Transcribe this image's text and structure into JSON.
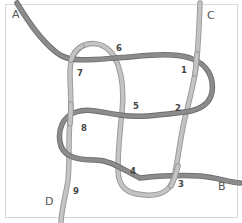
{
  "diagram": {
    "colors": {
      "frame": "#d9d9d9",
      "rope_dark": "#8c8c8c",
      "rope_light": "#c4c4c4",
      "labels": "#444444"
    },
    "end_labels": [
      {
        "id": "A",
        "text": "A",
        "x": 12,
        "y": 18
      },
      {
        "id": "B",
        "text": "B",
        "x": 218,
        "y": 190
      },
      {
        "id": "C",
        "text": "C",
        "x": 207,
        "y": 19
      },
      {
        "id": "D",
        "text": "D",
        "x": 45,
        "y": 205
      }
    ],
    "crossing_labels": [
      {
        "id": "1",
        "text": "1",
        "x": 181,
        "y": 73
      },
      {
        "id": "2",
        "text": "2",
        "x": 175,
        "y": 111
      },
      {
        "id": "3",
        "text": "3",
        "x": 178,
        "y": 187
      },
      {
        "id": "4",
        "text": "4",
        "x": 130,
        "y": 174
      },
      {
        "id": "5",
        "text": "5",
        "x": 133,
        "y": 109
      },
      {
        "id": "6",
        "text": "6",
        "x": 116,
        "y": 51
      },
      {
        "id": "7",
        "text": "7",
        "x": 77,
        "y": 76
      },
      {
        "id": "8",
        "text": "8",
        "x": 81,
        "y": 131
      },
      {
        "id": "9",
        "text": "9",
        "x": 73,
        "y": 194
      }
    ],
    "ropes": [
      {
        "id": "rope-A-B",
        "from": "A",
        "to": "B",
        "shade": "dark"
      },
      {
        "id": "rope-C-D",
        "from": "C",
        "to": "D",
        "shade": "light"
      }
    ]
  }
}
